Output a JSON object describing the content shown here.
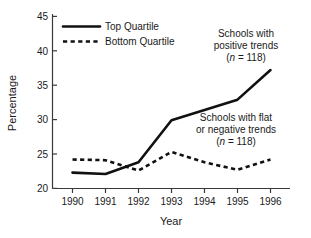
{
  "chart_data": {
    "type": "line",
    "title": "",
    "xlabel": "Year",
    "ylabel": "Percentage",
    "categories": [
      "1990",
      "1991",
      "1992",
      "1993",
      "1994",
      "1995",
      "1996"
    ],
    "x": [
      1990,
      1991,
      1992,
      1993,
      1994,
      1995,
      1996
    ],
    "xlim": [
      1990,
      1996
    ],
    "ylim": [
      20,
      45
    ],
    "yticks": [
      20,
      25,
      30,
      35,
      40,
      45
    ],
    "ytick_labels": [
      "20",
      "25",
      "30",
      "35",
      "40",
      "45"
    ],
    "xticks": [
      1990,
      1991,
      1992,
      1993,
      1994,
      1995,
      1996
    ],
    "xtick_labels": [
      "1990",
      "1991",
      "1992",
      "1993",
      "1994",
      "1995",
      "1996"
    ],
    "grid": false,
    "legend_position": "top-left",
    "series": [
      {
        "name": "Top Quartile",
        "style": "solid",
        "color": "#111111",
        "values": [
          22.3,
          22.1,
          23.8,
          29.9,
          31.4,
          32.9,
          37.2
        ]
      },
      {
        "name": "Bottom Quartile",
        "style": "dashed",
        "color": "#111111",
        "values": [
          24.2,
          24.1,
          22.6,
          25.3,
          23.8,
          22.7,
          24.2
        ]
      }
    ],
    "annotations": [
      {
        "id": "positive-trends",
        "lines": [
          "Schools with",
          "positive trends"
        ],
        "note_prefix": "n",
        "note_suffix": " = 118",
        "note_open": "(",
        "note_close": ")"
      },
      {
        "id": "flat-negative-trends",
        "lines": [
          "Schools with flat",
          "or negative trends"
        ],
        "note_prefix": "n",
        "note_suffix": " = 118",
        "note_open": "(",
        "note_close": ")"
      }
    ]
  },
  "legend": {
    "items": [
      {
        "label": "Top Quartile",
        "style": "solid"
      },
      {
        "label": "Bottom Quartile",
        "style": "dashed"
      }
    ]
  },
  "axes": {
    "y_title": "Percentage",
    "x_title": "Year",
    "y_tick_0": "20",
    "y_tick_1": "25",
    "y_tick_2": "30",
    "y_tick_3": "35",
    "y_tick_4": "40",
    "y_tick_5": "45",
    "x_tick_0": "1990",
    "x_tick_1": "1991",
    "x_tick_2": "1992",
    "x_tick_3": "1993",
    "x_tick_4": "1994",
    "x_tick_5": "1995",
    "x_tick_6": "1996"
  },
  "annotation_positive": {
    "line1": "Schools with",
    "line2": "positive trends",
    "n_italic": "n",
    "n_rest": " = 118)",
    "n_open": "("
  },
  "annotation_flat": {
    "line1": "Schools with flat",
    "line2": "or negative trends",
    "n_italic": "n",
    "n_rest": " = 118)",
    "n_open": "("
  },
  "colors": {
    "series": "#111111",
    "axis": "#3a3a3a",
    "background": "#ffffff",
    "text": "#1a1a1a"
  }
}
